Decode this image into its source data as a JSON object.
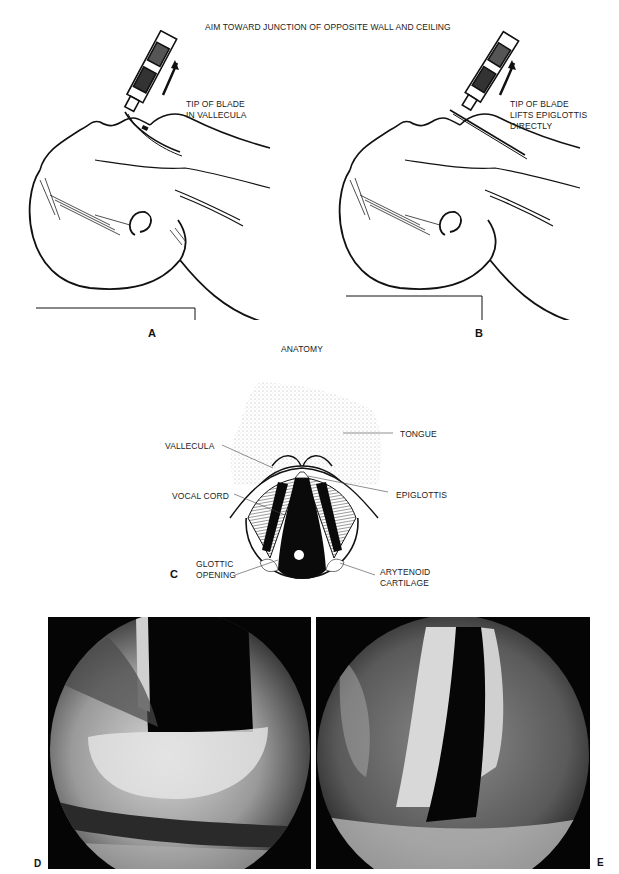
{
  "figure": {
    "header_caption": "AIM TOWARD JUNCTION OF OPPOSITE WALL AND CEILING",
    "section_caption": "ANATOMY",
    "panels": {
      "A": {
        "label": "A",
        "caption_line1": "TIP OF BLADE",
        "caption_line2": "IN VALLECULA"
      },
      "B": {
        "label": "B",
        "caption_line1": "TIP OF BLADE",
        "caption_line2": "LIFTS EPIGLOTTIS",
        "caption_line3": "DIRECTLY"
      },
      "C": {
        "label": "C",
        "annotations": {
          "tongue": "TONGUE",
          "vallecula": "VALLECULA",
          "epiglottis": "EPIGLOTTIS",
          "vocal_cord": "VOCAL CORD",
          "glottic_opening_1": "GLOTTIC",
          "glottic_opening_2": "OPENING",
          "arytenoid_1": "ARYTENOID",
          "arytenoid_2": "CARTILAGE"
        }
      },
      "D": {
        "label": "D"
      },
      "E": {
        "label": "E"
      }
    }
  }
}
